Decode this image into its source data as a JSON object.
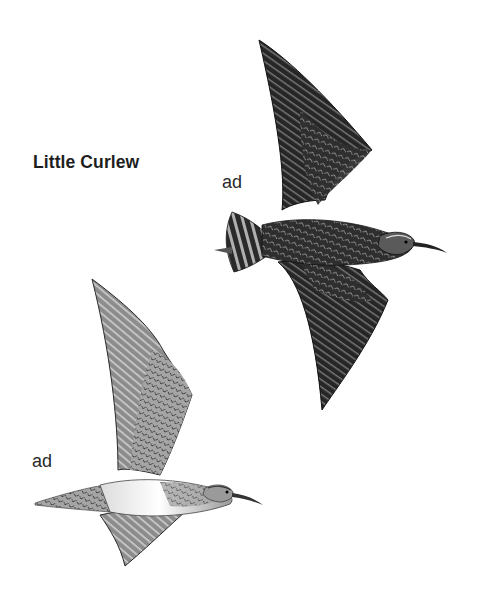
{
  "plate": {
    "species_title": "Little Curlew",
    "figures": [
      {
        "label": "ad",
        "description": "adult in flight, upperside view",
        "tone": "dark"
      },
      {
        "label": "ad",
        "description": "adult in flight, underside view",
        "tone": "light"
      }
    ]
  },
  "colors": {
    "background": "#ffffff",
    "text": "#1e1e1e",
    "dark_bird": "#2b2b2b",
    "light_bird": "#8a8a8a",
    "belly": "#f2f2f2"
  }
}
